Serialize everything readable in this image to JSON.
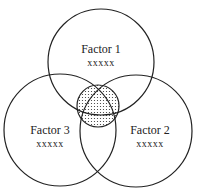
{
  "diagram": {
    "type": "venn",
    "circles": [
      {
        "id": "factor1",
        "label": "Factor 1",
        "sublabel": "xxxxx"
      },
      {
        "id": "factor2",
        "label": "Factor 2",
        "sublabel": "xxxxx"
      },
      {
        "id": "factor3",
        "label": "Factor 3",
        "sublabel": "xxxxx"
      }
    ],
    "center_region": {
      "fill": "dotted",
      "label": ""
    },
    "colors": {
      "stroke": "#222222",
      "background": "#ffffff",
      "dots": "#333333"
    }
  }
}
